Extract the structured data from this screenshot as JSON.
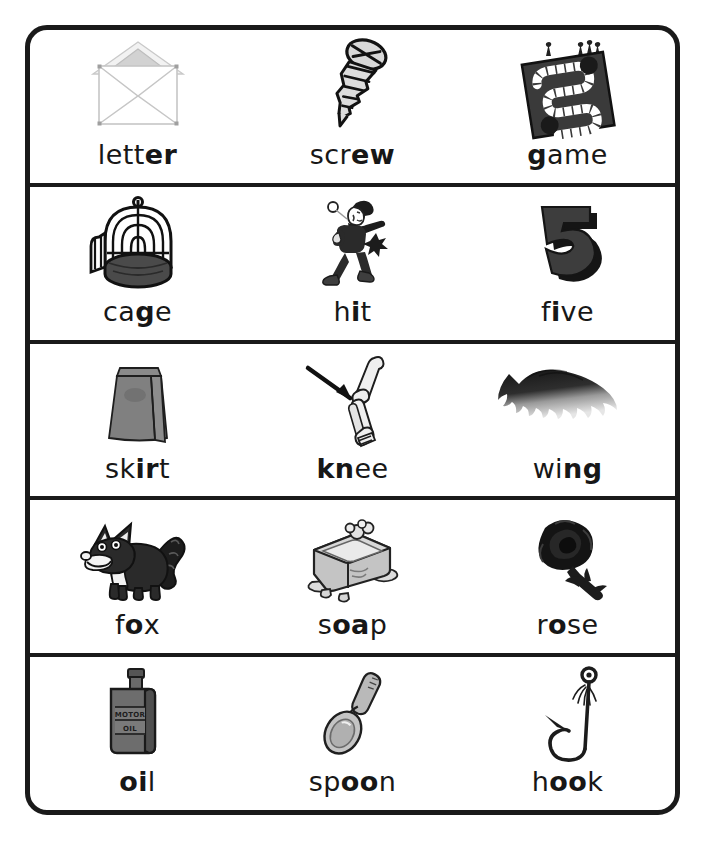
{
  "worksheet": {
    "title": "Phonics picture-word chart",
    "border_color": "#1a1a1a",
    "background_color": "#ffffff",
    "rows": 5,
    "columns": 3
  },
  "items": [
    {
      "id": "letter",
      "word": "letter",
      "plain_prefix": "lett",
      "bold_part": "er",
      "plain_suffix": "",
      "picture": "envelope-icon",
      "row": 1,
      "col": 1
    },
    {
      "id": "screw",
      "word": "screw",
      "plain_prefix": "scr",
      "bold_part": "ew",
      "plain_suffix": "",
      "picture": "screw-icon",
      "row": 1,
      "col": 2
    },
    {
      "id": "game",
      "word": "game",
      "plain_prefix": "",
      "bold_part": "g",
      "plain_suffix": "ame",
      "picture": "board-game-icon",
      "row": 1,
      "col": 3
    },
    {
      "id": "cage",
      "word": "cage",
      "plain_prefix": "ca",
      "bold_part": "g",
      "plain_suffix": "e",
      "picture": "birdcage-icon",
      "row": 2,
      "col": 1
    },
    {
      "id": "hit",
      "word": "hit",
      "plain_prefix": "h",
      "bold_part": "i",
      "plain_suffix": "t",
      "picture": "batter-icon",
      "row": 2,
      "col": 2
    },
    {
      "id": "five",
      "word": "five",
      "plain_prefix": "f",
      "bold_part": "i",
      "plain_suffix": "ve",
      "picture": "number-five-icon",
      "row": 2,
      "col": 3
    },
    {
      "id": "skirt",
      "word": "skirt",
      "plain_prefix": "sk",
      "bold_part": "ir",
      "plain_suffix": "t",
      "picture": "skirt-icon",
      "row": 3,
      "col": 1
    },
    {
      "id": "knee",
      "word": "knee",
      "plain_prefix": "",
      "bold_part": "kn",
      "plain_suffix": "ee",
      "picture": "knee-bones-icon",
      "row": 3,
      "col": 2
    },
    {
      "id": "wing",
      "word": "wing",
      "plain_prefix": "wi",
      "bold_part": "ng",
      "plain_suffix": "",
      "picture": "wing-icon",
      "row": 3,
      "col": 3
    },
    {
      "id": "fox",
      "word": "fox",
      "plain_prefix": "f",
      "bold_part": "o",
      "plain_suffix": "x",
      "picture": "fox-icon",
      "row": 4,
      "col": 1
    },
    {
      "id": "soap",
      "word": "soap",
      "plain_prefix": "s",
      "bold_part": "oa",
      "plain_suffix": "p",
      "picture": "soap-bar-icon",
      "row": 4,
      "col": 2
    },
    {
      "id": "rose",
      "word": "rose",
      "plain_prefix": "r",
      "bold_part": "o",
      "plain_suffix": "se",
      "picture": "rose-icon",
      "row": 4,
      "col": 3
    },
    {
      "id": "oil",
      "word": "oil",
      "plain_prefix": "",
      "bold_part": "oi",
      "plain_suffix": "l",
      "picture": "oil-bottle-icon",
      "row": 5,
      "col": 1
    },
    {
      "id": "spoon",
      "word": "spoon",
      "plain_prefix": "sp",
      "bold_part": "oo",
      "plain_suffix": "n",
      "picture": "spoon-icon",
      "row": 5,
      "col": 2
    },
    {
      "id": "hook",
      "word": "hook",
      "plain_prefix": "h",
      "bold_part": "oo",
      "plain_suffix": "k",
      "picture": "fish-hook-icon",
      "row": 5,
      "col": 3
    }
  ],
  "picture_text": {
    "oil_bottle_line1": "MOTOR",
    "oil_bottle_line2": "OIL"
  },
  "colors": {
    "ink": "#1a1a1a",
    "text": "#171717",
    "light_gray": "#d9d9d9",
    "mid_gray": "#a8a8a8",
    "dark_gray": "#555555",
    "near_black": "#2b2b2b"
  }
}
